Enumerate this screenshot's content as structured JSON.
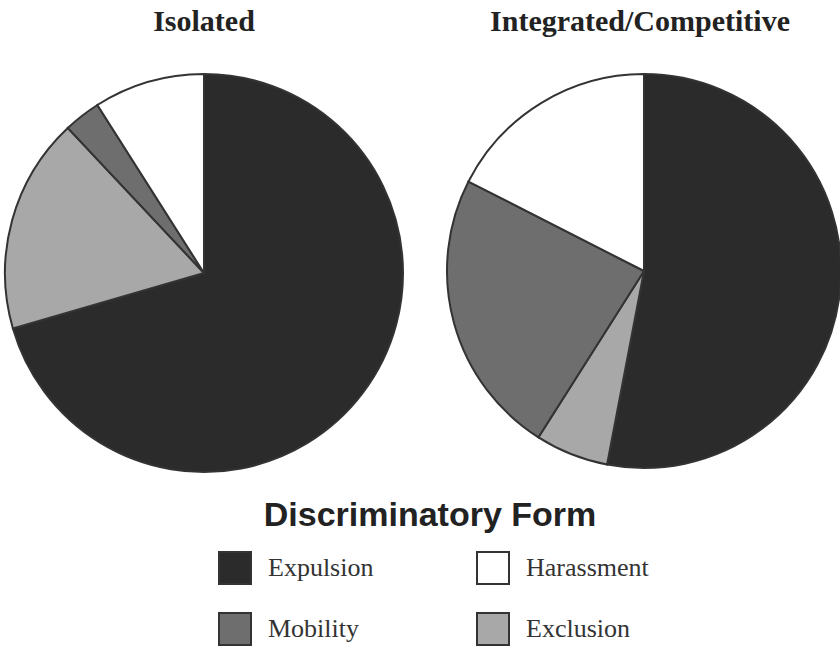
{
  "charts": {
    "left_title": "Isolated",
    "right_title": "Integrated/Competitive"
  },
  "legend": {
    "title": "Discriminatory Form",
    "items": [
      {
        "label": "Expulsion",
        "color": "#2b2b2b"
      },
      {
        "label": "Harassment",
        "color": "#ffffff"
      },
      {
        "label": "Mobility",
        "color": "#6e6e6e"
      },
      {
        "label": "Exclusion",
        "color": "#a8a8a8"
      }
    ]
  },
  "chart_data": [
    {
      "type": "pie",
      "title": "Isolated",
      "categories": [
        "Expulsion",
        "Exclusion",
        "Mobility",
        "Harassment"
      ],
      "values": [
        70.5,
        17.5,
        3,
        9
      ],
      "colors": [
        "#2b2b2b",
        "#a8a8a8",
        "#6e6e6e",
        "#ffffff"
      ],
      "start_angle_deg": 0,
      "direction": "clockwise",
      "legend_title": "Discriminatory Form",
      "legend_position": "bottom"
    },
    {
      "type": "pie",
      "title": "Integrated/Competitive",
      "categories": [
        "Expulsion",
        "Exclusion",
        "Mobility",
        "Harassment"
      ],
      "values": [
        53,
        6,
        23.5,
        17.5
      ],
      "colors": [
        "#2b2b2b",
        "#a8a8a8",
        "#6e6e6e",
        "#ffffff"
      ],
      "start_angle_deg": 0,
      "direction": "clockwise",
      "legend_title": "Discriminatory Form",
      "legend_position": "bottom"
    }
  ]
}
